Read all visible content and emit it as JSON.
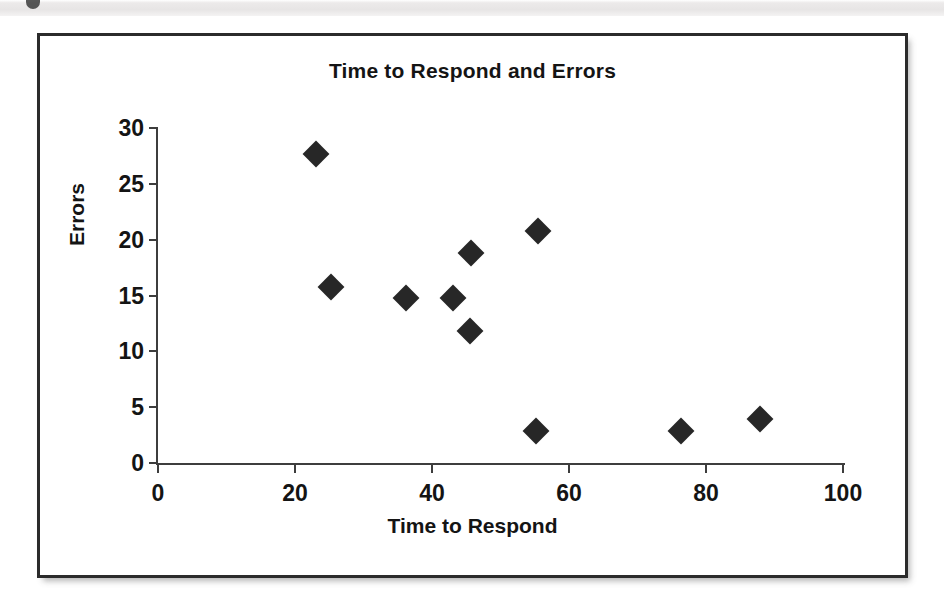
{
  "page": {
    "background_color": "#ffffff",
    "frame_border_color": "#2b2b2b",
    "top_band_glyph": "partial-figure-marker"
  },
  "chart_data": {
    "type": "scatter",
    "title": "Time to Respond and Errors",
    "xlabel": "Time to Respond",
    "ylabel": "Errors",
    "xlim": [
      0,
      100
    ],
    "ylim": [
      0,
      30
    ],
    "xticks": [
      0,
      20,
      40,
      60,
      80,
      100
    ],
    "yticks": [
      0,
      5,
      10,
      15,
      20,
      25,
      30
    ],
    "grid": false,
    "legend": null,
    "marker": "diamond",
    "marker_color": "#272727",
    "series": [
      {
        "name": "Observations",
        "points": [
          {
            "x": 23.0,
            "y": 27.7
          },
          {
            "x": 25.3,
            "y": 15.8
          },
          {
            "x": 36.2,
            "y": 14.8
          },
          {
            "x": 43.1,
            "y": 14.8
          },
          {
            "x": 45.7,
            "y": 18.8
          },
          {
            "x": 45.5,
            "y": 11.8
          },
          {
            "x": 55.5,
            "y": 20.8
          },
          {
            "x": 55.2,
            "y": 2.9
          },
          {
            "x": 76.4,
            "y": 2.9
          },
          {
            "x": 87.9,
            "y": 3.9
          }
        ]
      }
    ]
  }
}
